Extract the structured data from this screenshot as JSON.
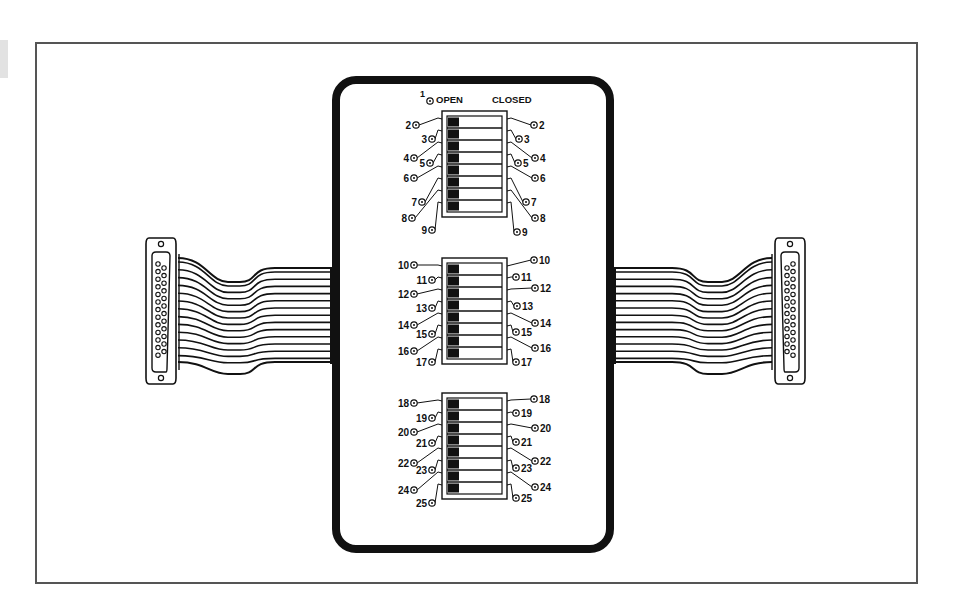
{
  "figure": {
    "type": "DIP switch breakout box wiring diagram",
    "headers": {
      "open": "OPEN",
      "closed": "CLOSED"
    },
    "pin_one_label": "1",
    "connectors": [
      {
        "side": "left",
        "kind": "DB-25"
      },
      {
        "side": "right",
        "kind": "DB-25"
      }
    ],
    "switch_banks": [
      {
        "id": "bank-1",
        "positions": 8,
        "state": "OPEN",
        "left_pins": [
          {
            "n": "2",
            "x": 416,
            "y": 125
          },
          {
            "n": "3",
            "x": 432,
            "y": 139
          },
          {
            "n": "4",
            "x": 414,
            "y": 158
          },
          {
            "n": "5",
            "x": 430,
            "y": 163
          },
          {
            "n": "6",
            "x": 414,
            "y": 178
          },
          {
            "n": "7",
            "x": 422,
            "y": 202
          },
          {
            "n": "8",
            "x": 412,
            "y": 218
          },
          {
            "n": "9",
            "x": 432,
            "y": 230
          }
        ],
        "right_pins": [
          {
            "n": "2",
            "x": 534,
            "y": 125
          },
          {
            "n": "3",
            "x": 519,
            "y": 139
          },
          {
            "n": "4",
            "x": 535,
            "y": 158
          },
          {
            "n": "5",
            "x": 518,
            "y": 163
          },
          {
            "n": "6",
            "x": 535,
            "y": 178
          },
          {
            "n": "7",
            "x": 526,
            "y": 202
          },
          {
            "n": "8",
            "x": 535,
            "y": 218
          },
          {
            "n": "9",
            "x": 517,
            "y": 232
          }
        ]
      },
      {
        "id": "bank-2",
        "positions": 8,
        "state": "OPEN",
        "left_pins": [
          {
            "n": "10",
            "x": 414,
            "y": 265
          },
          {
            "n": "11",
            "x": 432,
            "y": 280
          },
          {
            "n": "12",
            "x": 414,
            "y": 294
          },
          {
            "n": "13",
            "x": 432,
            "y": 308
          },
          {
            "n": "14",
            "x": 414,
            "y": 325
          },
          {
            "n": "15",
            "x": 432,
            "y": 334
          },
          {
            "n": "16",
            "x": 414,
            "y": 351
          },
          {
            "n": "17",
            "x": 432,
            "y": 362
          }
        ],
        "right_pins": [
          {
            "n": "10",
            "x": 534,
            "y": 260
          },
          {
            "n": "11",
            "x": 516,
            "y": 277
          },
          {
            "n": "12",
            "x": 535,
            "y": 288
          },
          {
            "n": "13",
            "x": 517,
            "y": 306
          },
          {
            "n": "14",
            "x": 535,
            "y": 323
          },
          {
            "n": "15",
            "x": 516,
            "y": 332
          },
          {
            "n": "16",
            "x": 535,
            "y": 348
          },
          {
            "n": "17",
            "x": 516,
            "y": 362
          }
        ]
      },
      {
        "id": "bank-3",
        "positions": 8,
        "state": "OPEN",
        "left_pins": [
          {
            "n": "18",
            "x": 414,
            "y": 403
          },
          {
            "n": "19",
            "x": 432,
            "y": 418
          },
          {
            "n": "20",
            "x": 414,
            "y": 432
          },
          {
            "n": "21",
            "x": 432,
            "y": 443
          },
          {
            "n": "22",
            "x": 414,
            "y": 463
          },
          {
            "n": "23",
            "x": 432,
            "y": 470
          },
          {
            "n": "24",
            "x": 414,
            "y": 490
          },
          {
            "n": "25",
            "x": 432,
            "y": 503
          }
        ],
        "right_pins": [
          {
            "n": "18",
            "x": 534,
            "y": 399
          },
          {
            "n": "19",
            "x": 516,
            "y": 413
          },
          {
            "n": "20",
            "x": 535,
            "y": 428
          },
          {
            "n": "21",
            "x": 516,
            "y": 442
          },
          {
            "n": "22",
            "x": 535,
            "y": 461
          },
          {
            "n": "23",
            "x": 516,
            "y": 468
          },
          {
            "n": "24",
            "x": 535,
            "y": 487
          },
          {
            "n": "25",
            "x": 516,
            "y": 498
          }
        ]
      }
    ]
  }
}
